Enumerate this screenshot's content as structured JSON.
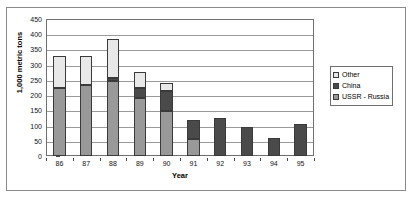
{
  "chart_data": {
    "type": "bar",
    "stacked": true,
    "title": "",
    "xlabel": "Year",
    "ylabel": "1,000 metric tons",
    "categories": [
      "86",
      "87",
      "88",
      "89",
      "90",
      "91",
      "92",
      "93",
      "94",
      "95"
    ],
    "series": [
      {
        "name": "USSR - Russia",
        "color": "#999999",
        "values": [
          225,
          232,
          245,
          190,
          148,
          55,
          0,
          0,
          0,
          0
        ]
      },
      {
        "name": "China",
        "color": "#4a4a4a",
        "values": [
          0,
          0,
          10,
          35,
          65,
          63,
          125,
          95,
          58,
          105
        ]
      },
      {
        "name": "Other",
        "color": "#e8e8e8",
        "values": [
          105,
          96,
          128,
          50,
          27,
          0,
          0,
          0,
          0,
          0
        ]
      }
    ],
    "totals": [
      330,
      328,
      383,
      275,
      240,
      118,
      125,
      95,
      58,
      105
    ],
    "ylim": [
      0,
      450
    ],
    "ytick_step": 50,
    "yticks": [
      "450",
      "400",
      "350",
      "300",
      "250",
      "200",
      "150",
      "100",
      "50",
      "0"
    ],
    "grid": true,
    "legend_position": "right",
    "legend_entries": [
      "Other",
      "China",
      "USSR - Russia"
    ]
  }
}
